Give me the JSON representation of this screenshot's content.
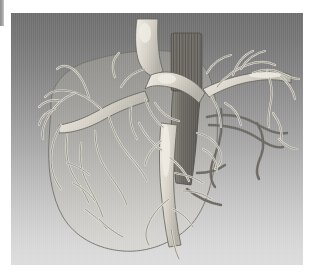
{
  "figure": {
    "domain_label": "medical-3d-visualization",
    "modality": "grayscale volume rendering",
    "caption_text": "",
    "panel": {
      "background_top_color": "#6d6d6d",
      "background_bottom_color": "#dcdcdc",
      "gradient_direction": "vertical top-dark to bottom-light",
      "x": 11,
      "y": 13,
      "width": 292,
      "height": 252
    },
    "gutter_strip": {
      "color": "#9a9a9a",
      "x": 0,
      "y": 0,
      "width": 4,
      "height": 26
    }
  },
  "structures": {
    "liver_capsule": {
      "name": "liver-capsule",
      "appearance": "semi-transparent pale envelope",
      "fill_color": "#b3afa6",
      "outline_color": "#6f6c65",
      "opacity": 0.3
    },
    "portal_vein_tree": {
      "name": "portal-vein-tree",
      "appearance": "bright cream branching tubes",
      "fill_color": "#d7d3c9",
      "highlight_color": "#efece4",
      "outline_color": "#5d5a53"
    },
    "hepatic_vein_tree": {
      "name": "hepatic-vein-tree",
      "appearance": "mid-gray branching tubes",
      "fill_color": "#bdb9b0",
      "outline_color": "#5d5a53"
    },
    "inferior_vena_cava": {
      "name": "inferior-vena-cava",
      "appearance": "dark hatched cylindrical trunk, cut plane",
      "fill_color": "#6f6c66",
      "outline_color": "#4a4843"
    },
    "shadowed_vessels": {
      "name": "shadowed-vessels",
      "appearance": "dark gray posterior branches on right side",
      "fill_color": "#6b6862"
    }
  },
  "labels": {
    "annotations": [],
    "scale_bar": "",
    "legend": []
  }
}
